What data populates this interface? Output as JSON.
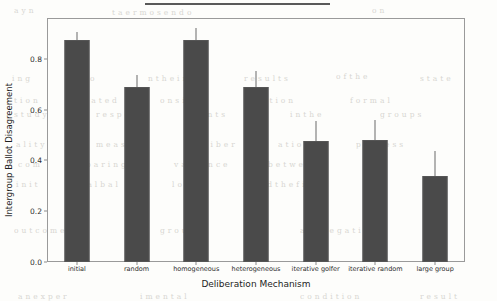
{
  "figure": {
    "background_color": "#fdfdfb",
    "bar_color": "#4a4a4a",
    "axis_color": "#9a9a9a",
    "scan_artifact": "dark-rule-top"
  },
  "ghost_text": [
    {
      "t": "a  y  n",
      "x": 14,
      "y": 6
    },
    {
      "t": "t a  e r  m  o  s e n  d  o",
      "x": 112,
      "y": 8
    },
    {
      "t": "o  n",
      "x": 372,
      "y": 6
    },
    {
      "t": "i n g",
      "x": 12,
      "y": 74
    },
    {
      "t": "e  r  o",
      "x": 76,
      "y": 74
    },
    {
      "t": "n  t  h  e  i  r",
      "x": 148,
      "y": 74
    },
    {
      "t": "r  e  s  u  l  t  s",
      "x": 244,
      "y": 74
    },
    {
      "t": "o  f  t  h  e",
      "x": 336,
      "y": 72
    },
    {
      "t": "s  t  a  t  e",
      "x": 420,
      "y": 74
    },
    {
      "t": "t  i o n",
      "x": 14,
      "y": 96
    },
    {
      "t": "c  a  t  e  d",
      "x": 84,
      "y": 96
    },
    {
      "t": "o n  s i d e r",
      "x": 160,
      "y": 96
    },
    {
      "t": "a  t  i  o  n",
      "x": 262,
      "y": 96
    },
    {
      "t": "f  o  r  m  a  l",
      "x": 350,
      "y": 96
    },
    {
      "t": "s t u d y",
      "x": 14,
      "y": 110
    },
    {
      "t": "r e s p o n d",
      "x": 96,
      "y": 110
    },
    {
      "t": "e  n  t  s",
      "x": 200,
      "y": 110
    },
    {
      "t": "i n  t h e",
      "x": 290,
      "y": 110
    },
    {
      "t": "g  r o u p s",
      "x": 380,
      "y": 110
    },
    {
      "t": "a  l  i  t  y",
      "x": 16,
      "y": 140
    },
    {
      "t": "m  e  a  s  u  r  e",
      "x": 96,
      "y": 140
    },
    {
      "t": "d  e  l  i  b  e  r",
      "x": 190,
      "y": 140
    },
    {
      "t": "a  t  i  o  n",
      "x": 278,
      "y": 140
    },
    {
      "t": "p  r  o  c  e  s  s",
      "x": 356,
      "y": 140
    },
    {
      "t": "c  o  m",
      "x": 18,
      "y": 160
    },
    {
      "t": "p  a  r  i  n  g",
      "x": 86,
      "y": 160
    },
    {
      "t": "v  a  r  i  a  n  c  e",
      "x": 174,
      "y": 160
    },
    {
      "t": "b  e t w e e n",
      "x": 268,
      "y": 160
    },
    {
      "t": "t  h  e",
      "x": 366,
      "y": 160
    },
    {
      "t": "i n i t",
      "x": 16,
      "y": 180
    },
    {
      "t": "i a l  b a l",
      "x": 82,
      "y": 180
    },
    {
      "t": "l  o  t  s",
      "x": 172,
      "y": 180
    },
    {
      "t": "a n d  t h e  f i n a l",
      "x": 252,
      "y": 180
    },
    {
      "t": "o  u  t  c  o  m  e",
      "x": 14,
      "y": 226
    },
    {
      "t": "g  r  o  u  p",
      "x": 160,
      "y": 226
    },
    {
      "t": "a  g  g  r  e  g  a  t  i  o  n",
      "x": 300,
      "y": 226
    },
    {
      "t": "a n  e x p e r",
      "x": 18,
      "y": 292
    },
    {
      "t": "i m e n t a l",
      "x": 140,
      "y": 292
    },
    {
      "t": "c o n d i t i o n",
      "x": 300,
      "y": 292
    },
    {
      "t": "r e s u l t",
      "x": 420,
      "y": 292
    }
  ],
  "chart_data": {
    "type": "bar",
    "title": "",
    "xlabel": "Deliberation Mechanism",
    "ylabel": "Intergroup Ballot Disagreement",
    "categories": [
      "initial",
      "random",
      "homogeneous",
      "heterogeneous",
      "iterative golfer",
      "iterative random",
      "large group"
    ],
    "values": [
      0.875,
      0.688,
      0.875,
      0.69,
      0.476,
      0.48,
      0.34
    ],
    "error_high": [
      0.905,
      0.735,
      0.92,
      0.75,
      0.556,
      0.56,
      0.435
    ],
    "error_low": [
      0.875,
      0.688,
      0.875,
      0.69,
      0.476,
      0.48,
      0.34
    ],
    "ylim": [
      0.0,
      0.96
    ],
    "yticks": [
      0.0,
      0.2,
      0.4,
      0.6,
      0.8
    ],
    "ytick_labels": [
      "0.0",
      "0.2",
      "0.4",
      "0.6",
      "0.8"
    ],
    "grid": false,
    "legend": null,
    "bar_color": "#4a4a4a",
    "error_color": "#6a6a6a"
  }
}
